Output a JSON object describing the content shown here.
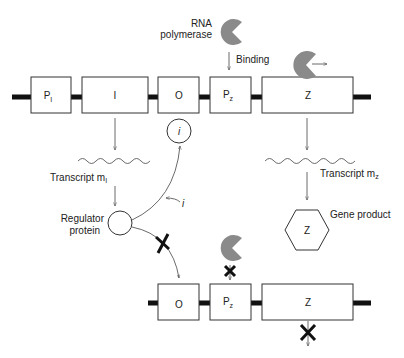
{
  "top_operon": {
    "genes": [
      {
        "id": "Pi",
        "main": "P",
        "sub": "I"
      },
      {
        "id": "I",
        "main": "I",
        "sub": ""
      },
      {
        "id": "O",
        "main": "O",
        "sub": ""
      },
      {
        "id": "Pz",
        "main": "P",
        "sub": "z"
      },
      {
        "id": "Z",
        "main": "Z",
        "sub": ""
      }
    ]
  },
  "bottom_operon": {
    "genes": [
      {
        "id": "O",
        "main": "O",
        "sub": ""
      },
      {
        "id": "Pz",
        "main": "P",
        "sub": "z"
      },
      {
        "id": "Z",
        "main": "Z",
        "sub": ""
      }
    ]
  },
  "labels": {
    "rna_polymerase_line1": "RNA",
    "rna_polymerase_line2": "polymerase",
    "binding": "Binding",
    "transcript_mi_main": "Transcript m",
    "transcript_mi_sub": "I",
    "transcript_mz_main": "Transcript m",
    "transcript_mz_sub": "z",
    "regulator_line1": "Regulator",
    "regulator_line2": "protein",
    "inducer_bound": "i",
    "inducer_free": "i",
    "gene_product_label": "Gene product",
    "gene_product_symbol": "Z"
  },
  "colors": {
    "polymerase": "#8a8a8a",
    "dna": "#111111",
    "outline": "#333333"
  }
}
